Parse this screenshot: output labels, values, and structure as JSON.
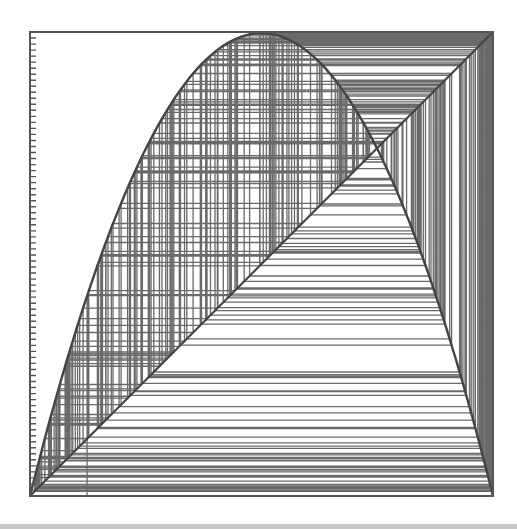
{
  "chart_data": {
    "type": "line",
    "subtype": "cobweb",
    "title": "",
    "xlabel": "",
    "ylabel": "",
    "xlim": [
      0,
      1
    ],
    "ylim": [
      0,
      1
    ],
    "grid": false,
    "legend": null,
    "function": "f(x) = r * x * (1 - x)",
    "r": 3.99,
    "x0": 0.1234,
    "iterations": 260,
    "series": [
      {
        "name": "logistic-parabola",
        "description": "f(x) = r x (1 - x), peak at x=0.5 near y=1"
      },
      {
        "name": "identity-diagonal",
        "description": "y = x from (0,0) to (1,1)"
      },
      {
        "name": "cobweb-trajectory",
        "description": "alternating vertical/horizontal segments between parabola and diagonal"
      }
    ],
    "fixed_point": {
      "x": 0.749,
      "y": 0.749
    },
    "y_ticks": {
      "count": 77,
      "labels": []
    }
  },
  "frame": {
    "left": 30,
    "top": 32,
    "width": 463,
    "height": 464
  },
  "colors": {
    "background": "#ffffff",
    "frame": "#555555",
    "curve": "#444444",
    "cobweb": "#6a6a6a",
    "tick": "#555555",
    "band": "#c8c8c8"
  }
}
